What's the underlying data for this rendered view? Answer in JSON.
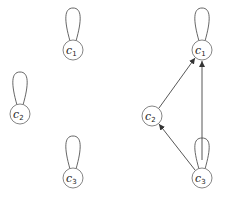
{
  "graphs": [
    {
      "name": "left",
      "nodes": [
        {
          "id": "c1",
          "base": "c",
          "sub": "1",
          "x": 73,
          "y": 50,
          "self_loop": true
        },
        {
          "id": "c2",
          "base": "c",
          "sub": "2",
          "x": 20,
          "y": 114,
          "self_loop": true
        },
        {
          "id": "c3",
          "base": "c",
          "sub": "3",
          "x": 73,
          "y": 178,
          "self_loop": true
        }
      ],
      "edges": []
    },
    {
      "name": "right",
      "nodes": [
        {
          "id": "c1",
          "base": "c",
          "sub": "1",
          "x": 202,
          "y": 50,
          "self_loop": true
        },
        {
          "id": "c2",
          "base": "c",
          "sub": "2",
          "x": 152,
          "y": 116,
          "self_loop": false
        },
        {
          "id": "c3",
          "base": "c",
          "sub": "3",
          "x": 202,
          "y": 178,
          "self_loop": true
        }
      ],
      "edges": [
        {
          "from": "c2",
          "to": "c1"
        },
        {
          "from": "c3",
          "to": "c1"
        },
        {
          "from": "c3",
          "to": "c2"
        }
      ]
    }
  ],
  "colors": {
    "stroke": "#555555",
    "node_border": "#777777",
    "text": "#222222"
  }
}
